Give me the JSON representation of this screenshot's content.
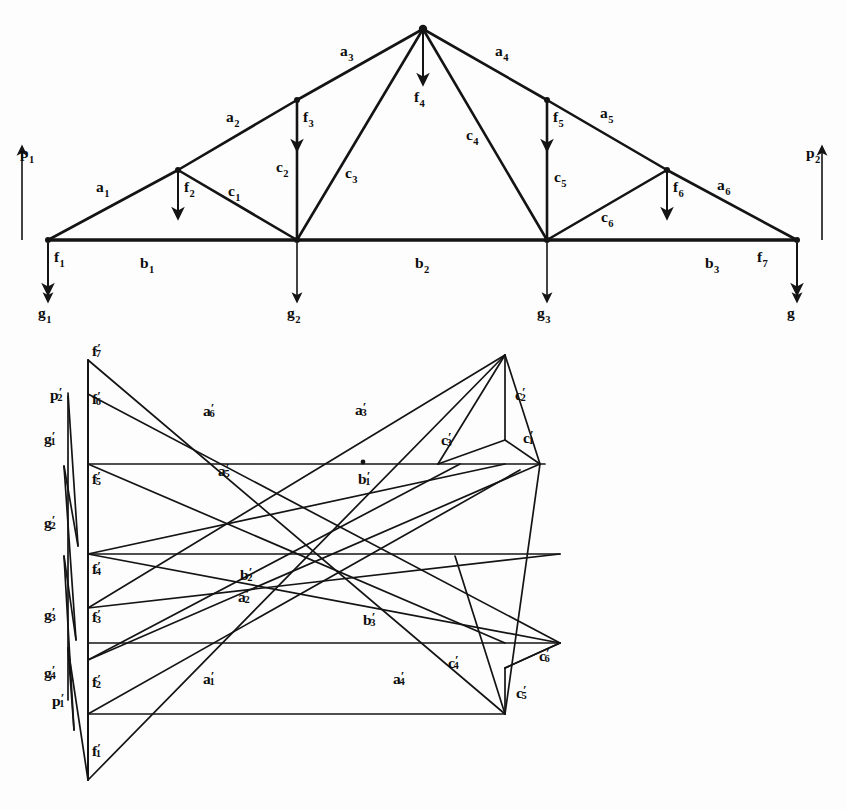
{
  "figure": {
    "ink_color": "#141414",
    "paper_color": "#fdfdfd"
  },
  "truss": {
    "name": "upper-truss-diagram",
    "description": "Symmetric king-post / fink roof truss on two supports",
    "span_nodes": [
      "left-support",
      "panel-point-2",
      "panel-point-3",
      "right-support"
    ],
    "reactions": [
      {
        "name": "p1",
        "label": "p",
        "sub": "1",
        "direction": "up",
        "x": 22,
        "y": 150,
        "tail_y": 240,
        "text_x": 20,
        "text_y": 158
      },
      {
        "name": "p2",
        "label": "p",
        "sub": "2",
        "direction": "up",
        "x": 822,
        "y": 150,
        "tail_y": 240,
        "text_x": 806,
        "text_y": 158
      }
    ],
    "loads": [
      {
        "name": "f1",
        "label": "f",
        "sub": "1",
        "x": 48,
        "y0": 243,
        "y1": 290,
        "text_x": 54,
        "text_y": 262
      },
      {
        "name": "f2",
        "label": "f",
        "sub": "2",
        "x": 178,
        "y0": 170,
        "y1": 214,
        "text_x": 184,
        "text_y": 192
      },
      {
        "name": "f3",
        "label": "f",
        "sub": "3",
        "x": 297,
        "y0": 100,
        "y1": 146,
        "text_x": 303,
        "text_y": 122
      },
      {
        "name": "f4",
        "label": "f",
        "sub": "4",
        "x": 423,
        "y0": 32,
        "y1": 80,
        "text_x": 414,
        "text_y": 102
      },
      {
        "name": "f5",
        "label": "f",
        "sub": "5",
        "x": 547,
        "y0": 100,
        "y1": 146,
        "text_x": 553,
        "text_y": 122
      },
      {
        "name": "f6",
        "label": "f",
        "sub": "6",
        "x": 667,
        "y0": 170,
        "y1": 214,
        "text_x": 673,
        "text_y": 192
      },
      {
        "name": "f7",
        "label": "f",
        "sub": "7",
        "x": 797,
        "y0": 243,
        "y1": 290,
        "text_x": 757,
        "text_y": 262
      }
    ],
    "ground_forces": [
      {
        "name": "g1",
        "label": "g",
        "sub": "1",
        "x": 48,
        "y0": 243,
        "y1": 298,
        "text_x": 38,
        "text_y": 318
      },
      {
        "name": "g2",
        "label": "g",
        "sub": "2",
        "x": 297,
        "y0": 243,
        "y1": 298,
        "text_x": 287,
        "text_y": 318
      },
      {
        "name": "g3",
        "label": "g",
        "sub": "3",
        "x": 547,
        "y0": 243,
        "y1": 298,
        "text_x": 537,
        "text_y": 318
      },
      {
        "name": "g4",
        "label": "g",
        "sub": "",
        "x": 797,
        "y0": 243,
        "y1": 298,
        "text_x": 787,
        "text_y": 318
      }
    ],
    "members": [
      {
        "name": "a1",
        "label": "a",
        "sub": "1",
        "x1": 48,
        "y1": 240,
        "x2": 178,
        "y2": 170,
        "text_x": 96,
        "text_y": 192
      },
      {
        "name": "a2",
        "label": "a",
        "sub": "2",
        "x1": 178,
        "y1": 170,
        "x2": 297,
        "y2": 100,
        "text_x": 226,
        "text_y": 122
      },
      {
        "name": "a3",
        "label": "a",
        "sub": "3",
        "x1": 297,
        "y1": 100,
        "x2": 423,
        "y2": 29,
        "text_x": 340,
        "text_y": 56
      },
      {
        "name": "a4",
        "label": "a",
        "sub": "4",
        "x1": 423,
        "y1": 29,
        "x2": 547,
        "y2": 100,
        "text_x": 495,
        "text_y": 56
      },
      {
        "name": "a5",
        "label": "a",
        "sub": "5",
        "x1": 547,
        "y1": 100,
        "x2": 667,
        "y2": 170,
        "text_x": 600,
        "text_y": 118
      },
      {
        "name": "a6",
        "label": "a",
        "sub": "6",
        "x1": 667,
        "y1": 170,
        "x2": 797,
        "y2": 240,
        "text_x": 717,
        "text_y": 190
      },
      {
        "name": "b1",
        "label": "b",
        "sub": "1",
        "x1": 48,
        "y1": 240,
        "x2": 297,
        "y2": 240,
        "text_x": 140,
        "text_y": 268
      },
      {
        "name": "b2",
        "label": "b",
        "sub": "2",
        "x1": 297,
        "y1": 240,
        "x2": 547,
        "y2": 240,
        "text_x": 415,
        "text_y": 268
      },
      {
        "name": "b3",
        "label": "b",
        "sub": "3",
        "x1": 547,
        "y1": 240,
        "x2": 797,
        "y2": 240,
        "text_x": 705,
        "text_y": 268
      },
      {
        "name": "c1",
        "label": "c",
        "sub": "1",
        "x1": 178,
        "y1": 170,
        "x2": 297,
        "y2": 240,
        "text_x": 228,
        "text_y": 196
      },
      {
        "name": "c2",
        "label": "c",
        "sub": "2",
        "x1": 297,
        "y1": 100,
        "x2": 297,
        "y2": 240,
        "text_x": 276,
        "text_y": 172
      },
      {
        "name": "c3",
        "label": "c",
        "sub": "3",
        "x1": 297,
        "y1": 240,
        "x2": 423,
        "y2": 29,
        "text_x": 345,
        "text_y": 178
      },
      {
        "name": "c4",
        "label": "c",
        "sub": "4",
        "x1": 423,
        "y1": 29,
        "x2": 547,
        "y2": 240,
        "text_x": 466,
        "text_y": 140
      },
      {
        "name": "c5",
        "label": "c",
        "sub": "5",
        "x1": 547,
        "y1": 100,
        "x2": 547,
        "y2": 240,
        "text_x": 554,
        "text_y": 182
      },
      {
        "name": "c6",
        "label": "c",
        "sub": "6",
        "x1": 547,
        "y1": 240,
        "x2": 667,
        "y2": 170,
        "text_x": 601,
        "text_y": 222
      }
    ],
    "joints": [
      {
        "name": "joint-left-support",
        "x": 48,
        "y": 240
      },
      {
        "name": "joint-a1-a2",
        "x": 178,
        "y": 170
      },
      {
        "name": "joint-panel-2",
        "x": 297,
        "y": 240
      },
      {
        "name": "joint-c2-top",
        "x": 297,
        "y": 100
      },
      {
        "name": "joint-apex",
        "x": 423,
        "y": 29
      },
      {
        "name": "joint-c5-top",
        "x": 547,
        "y": 100
      },
      {
        "name": "joint-panel-3",
        "x": 547,
        "y": 240
      },
      {
        "name": "joint-a5-a6",
        "x": 667,
        "y": 170
      },
      {
        "name": "joint-right-support",
        "x": 797,
        "y": 240
      }
    ]
  },
  "force_diagram": {
    "name": "lower-reciprocal-diagram",
    "description": "Reciprocal force polygon; primed letters correspond to truss members",
    "load_line": {
      "name": "load-line",
      "x": 88,
      "y_top": 360,
      "y_bottom": 780,
      "points": [
        {
          "name": "f7p",
          "label": "f",
          "sub": "7",
          "prime": true,
          "x": 88,
          "y": 360,
          "text_x": 92,
          "text_y": 356
        },
        {
          "name": "f6p",
          "label": "f",
          "sub": "6",
          "prime": true,
          "x": 88,
          "y": 394,
          "text_x": 92,
          "text_y": 404
        },
        {
          "name": "f5p",
          "label": "f",
          "sub": "5",
          "prime": true,
          "x": 88,
          "y": 464,
          "text_x": 92,
          "text_y": 484
        },
        {
          "name": "f4p",
          "label": "f",
          "sub": "4",
          "prime": true,
          "x": 88,
          "y": 554,
          "text_x": 92,
          "text_y": 574
        },
        {
          "name": "f3p",
          "label": "f",
          "sub": "3",
          "prime": true,
          "x": 88,
          "y": 608,
          "text_x": 92,
          "text_y": 622
        },
        {
          "name": "f2p",
          "label": "f",
          "sub": "2",
          "prime": true,
          "x": 88,
          "y": 660,
          "text_x": 92,
          "text_y": 687
        },
        {
          "name": "f1p",
          "label": "f",
          "sub": "1",
          "prime": true,
          "x": 88,
          "y": 780,
          "text_x": 92,
          "text_y": 756
        }
      ]
    },
    "closing_line": {
      "name": "closing-line-p1-p2",
      "points": [
        {
          "name": "p2p",
          "label": "p",
          "sub": "2",
          "prime": true,
          "x": 68,
          "y": 396,
          "text_x": 50,
          "text_y": 400
        },
        {
          "name": "p1p",
          "label": "p",
          "sub": "1",
          "prime": true,
          "x": 68,
          "y": 700,
          "text_x": 52,
          "text_y": 706
        }
      ],
      "zigzag": [
        {
          "x": 68,
          "y": 393
        },
        {
          "x": 78,
          "y": 546
        },
        {
          "x": 64,
          "y": 466
        },
        {
          "x": 76,
          "y": 640
        },
        {
          "x": 64,
          "y": 556
        },
        {
          "x": 74,
          "y": 730
        },
        {
          "x": 68,
          "y": 648
        },
        {
          "x": 88,
          "y": 780
        }
      ]
    },
    "reaction_segments": [
      {
        "name": "g1p",
        "label": "g",
        "sub": "1",
        "prime": true,
        "x": 68,
        "y0": 396,
        "y1": 466,
        "text_x": 44,
        "text_y": 444
      },
      {
        "name": "g2p",
        "label": "g",
        "sub": "2",
        "prime": true,
        "x": 68,
        "y0": 466,
        "y1": 556,
        "text_x": 44,
        "text_y": 528
      },
      {
        "name": "g3p",
        "label": "g",
        "sub": "3",
        "prime": true,
        "x": 68,
        "y0": 556,
        "y1": 648,
        "text_x": 44,
        "text_y": 620
      },
      {
        "name": "g4p",
        "label": "g",
        "sub": "4",
        "prime": true,
        "x": 68,
        "y0": 648,
        "y1": 700,
        "text_x": 44,
        "text_y": 678
      }
    ],
    "horizontals": [
      {
        "name": "b1p",
        "label": "b",
        "sub": "1",
        "prime": true,
        "x1": 88,
        "y1": 464,
        "x2": 545,
        "y2": 464,
        "text_x": 358,
        "text_y": 484,
        "dot_x": 363,
        "dot_y": 462
      },
      {
        "name": "b2p",
        "label": "b",
        "sub": "2",
        "prime": true,
        "x1": 88,
        "y1": 554,
        "x2": 560,
        "y2": 554,
        "text_x": 240,
        "text_y": 580,
        "dot_x": null,
        "dot_y": null
      },
      {
        "name": "b3p",
        "label": "b",
        "sub": "3",
        "prime": true,
        "x1": 88,
        "y1": 643,
        "x2": 560,
        "y2": 643,
        "text_x": 363,
        "text_y": 625,
        "dot_x": null,
        "dot_y": null
      }
    ],
    "rafter_lines": [
      {
        "name": "a6p",
        "label": "a",
        "sub": "6",
        "prime": true,
        "x1": 88,
        "y1": 360,
        "x2": 505,
        "y2": 714,
        "text_x": 203,
        "text_y": 416
      },
      {
        "name": "a5p",
        "label": "a",
        "sub": "5",
        "prime": true,
        "x1": 88,
        "y1": 394,
        "x2": 505,
        "y2": 748,
        "text_x": 218,
        "text_y": 476
      },
      {
        "name": "a3p",
        "label": "a",
        "sub": "3",
        "prime": true,
        "x1": 88,
        "y1": 780,
        "x2": 505,
        "y2": 355,
        "text_x": 355,
        "text_y": 415
      },
      {
        "name": "a4p",
        "label": "a",
        "sub": "4",
        "prime": true,
        "x1": 88,
        "y1": 360,
        "x2": 505,
        "y2": 714,
        "text_x": 393,
        "text_y": 684
      },
      {
        "name": "a2p",
        "label": "a",
        "sub": "2",
        "prime": true,
        "x1": 88,
        "y1": 660,
        "x2": 438,
        "y2": 464,
        "text_x": 238,
        "text_y": 602
      },
      {
        "name": "a1p",
        "label": "a",
        "sub": "1",
        "prime": true,
        "x1": 88,
        "y1": 714,
        "x2": 520,
        "y2": 470,
        "text_x": 203,
        "text_y": 684
      }
    ],
    "diagonals": [
      {
        "name": "c1p",
        "label": "c",
        "sub": "1",
        "prime": true,
        "x1": 540,
        "y1": 464,
        "x2": 490,
        "y2": 440,
        "text_x": 523,
        "text_y": 443
      },
      {
        "name": "c2p",
        "label": "c",
        "sub": "2",
        "prime": true,
        "x1": 505,
        "y1": 355,
        "x2": 505,
        "y2": 440,
        "text_x": 515,
        "text_y": 400
      },
      {
        "name": "c3p",
        "label": "c",
        "sub": "3",
        "prime": true,
        "x1": 440,
        "y1": 466,
        "x2": 505,
        "y2": 355,
        "text_x": 441,
        "text_y": 445
      },
      {
        "name": "c4p",
        "label": "c",
        "sub": "4",
        "prime": true,
        "x1": 505,
        "y1": 643,
        "x2": 505,
        "y2": 714,
        "text_x": 448,
        "text_y": 668
      },
      {
        "name": "c5p",
        "label": "c",
        "sub": "5",
        "prime": true,
        "x1": 505,
        "y1": 643,
        "x2": 505,
        "y2": 714,
        "text_x": 516,
        "text_y": 698
      },
      {
        "name": "c6p",
        "label": "c",
        "sub": "6",
        "prime": true,
        "x1": 560,
        "y1": 643,
        "x2": 505,
        "y2": 668,
        "text_x": 539,
        "text_y": 661
      }
    ]
  }
}
